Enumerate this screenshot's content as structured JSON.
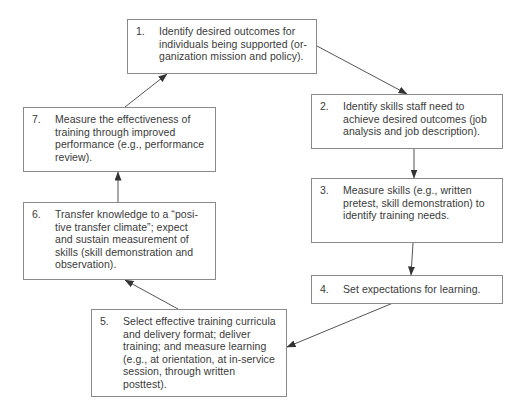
{
  "diagram": {
    "type": "cycle-flowchart",
    "steps": [
      {
        "number": "1.",
        "lines": [
          "Identify desired outcomes for",
          "individuals being supported (or-",
          "ganization mission and policy)."
        ]
      },
      {
        "number": "2.",
        "lines": [
          "Identify skills staff need to",
          "achieve desired outcomes (job",
          "analysis and job description)."
        ]
      },
      {
        "number": "3.",
        "lines": [
          "Measure skills (e.g., written",
          "pretest, skill demonstration) to",
          "identify training needs."
        ]
      },
      {
        "number": "4.",
        "lines": [
          "Set expectations for learning."
        ]
      },
      {
        "number": "5.",
        "lines": [
          "Select effective training curricula",
          "and delivery format; deliver",
          "training; and measure learning",
          "(e.g., at orientation, at in-service",
          "session, through written",
          "posttest)."
        ]
      },
      {
        "number": "6.",
        "lines": [
          "Transfer knowledge to a “posi-",
          "tive transfer climate”; expect",
          "and sustain measurement of",
          "skills (skill demonstration and",
          "observation)."
        ]
      },
      {
        "number": "7.",
        "lines": [
          "Measure the effectiveness of",
          "training through improved",
          "performance (e.g., performance",
          "review)."
        ]
      }
    ],
    "edges": [
      {
        "from": "1",
        "to": "2"
      },
      {
        "from": "2",
        "to": "3"
      },
      {
        "from": "3",
        "to": "4"
      },
      {
        "from": "4",
        "to": "5"
      },
      {
        "from": "5",
        "to": "6"
      },
      {
        "from": "6",
        "to": "7"
      },
      {
        "from": "7",
        "to": "1"
      }
    ],
    "colors": {
      "border": "#8a8a8a",
      "text": "#3a3a3a",
      "arrow": "#333333"
    }
  }
}
